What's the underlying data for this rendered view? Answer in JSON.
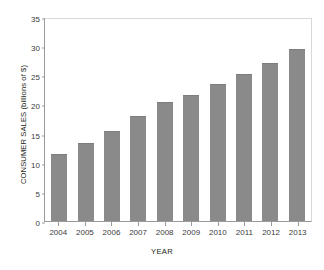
{
  "chart_data": {
    "type": "bar",
    "title": "U.S. ORGANIC FOOD SALES",
    "xlabel": "YEAR",
    "ylabel": "CONSUMER SALES (billions of $)",
    "categories": [
      "2004",
      "2005",
      "2006",
      "2007",
      "2008",
      "2009",
      "2010",
      "2011",
      "2012",
      "2013"
    ],
    "values": [
      11.5,
      13.3,
      15.4,
      18.0,
      20.4,
      21.6,
      23.5,
      25.2,
      27.1,
      29.5
    ],
    "ylim": [
      0,
      35
    ],
    "yticks": [
      0,
      5,
      10,
      15,
      20,
      25,
      30,
      35
    ],
    "ytick_labels": [
      "0",
      "5",
      "10",
      "15",
      "20",
      "25",
      "30",
      "35"
    ],
    "grid": false,
    "legend": null,
    "series_color": "#8a8a8a",
    "axis_color": "#9a9a9a",
    "frame_color": "#d9d9d9"
  }
}
